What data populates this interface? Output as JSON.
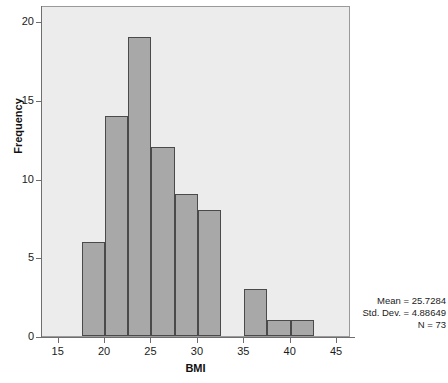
{
  "chart_data": {
    "type": "bar",
    "title": "",
    "xlabel": "BMI",
    "ylabel": "Frequency",
    "xlim": [
      13.2,
      46.5
    ],
    "ylim": [
      0,
      21
    ],
    "grid": false,
    "legend": null,
    "bin_width": 2.5,
    "categories": [
      "17.5-20",
      "20-22.5",
      "22.5-25",
      "25-27.5",
      "27.5-30",
      "30-32.5",
      "32.5-35",
      "35-37.5",
      "37.5-40",
      "40-42.5"
    ],
    "bins": [
      {
        "start": 17.5,
        "end": 20.0,
        "value": 6
      },
      {
        "start": 20.0,
        "end": 22.5,
        "value": 14
      },
      {
        "start": 22.5,
        "end": 25.0,
        "value": 19
      },
      {
        "start": 25.0,
        "end": 27.5,
        "value": 12
      },
      {
        "start": 27.5,
        "end": 30.0,
        "value": 9
      },
      {
        "start": 30.0,
        "end": 32.5,
        "value": 8
      },
      {
        "start": 32.5,
        "end": 35.0,
        "value": 0
      },
      {
        "start": 35.0,
        "end": 37.5,
        "value": 3
      },
      {
        "start": 37.5,
        "end": 40.0,
        "value": 1
      },
      {
        "start": 40.0,
        "end": 42.5,
        "value": 1
      }
    ],
    "values": [
      6,
      14,
      19,
      12,
      9,
      8,
      0,
      3,
      1,
      1
    ],
    "xticks": [
      15,
      20,
      25,
      30,
      35,
      40,
      45
    ],
    "xtick_labels": [
      "15",
      "20",
      "25",
      "30",
      "35",
      "40",
      "45"
    ],
    "yticks": [
      0,
      5,
      10,
      15,
      20
    ],
    "ytick_labels": [
      "0",
      "5",
      "10",
      "15",
      "20"
    ],
    "annotations": [
      "Mean = 25.7284",
      "Std. Dev. = 4.88649",
      "N = 73"
    ],
    "colors": {
      "bar_fill": "#a8a8a8",
      "bar_stroke": "#4a4a4a",
      "plot_background": "#ececec",
      "page_background": "#ffffff",
      "axis": "#6e6e6e",
      "text": "#1b1b1b"
    }
  },
  "stats": {
    "mean_label": "Mean = 25.7284",
    "std_label": "Std. Dev. = 4.88649",
    "n_label": "N = 73"
  },
  "axes": {
    "x_title": "BMI",
    "y_title": "Frequency"
  }
}
